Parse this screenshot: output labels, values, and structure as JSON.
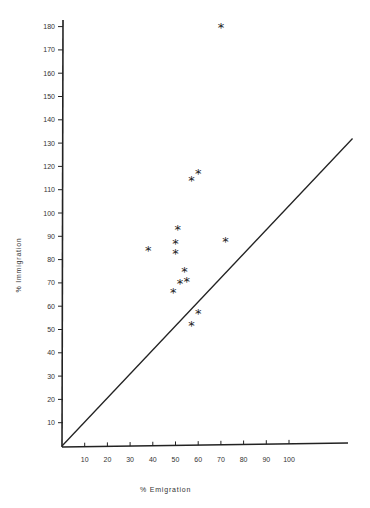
{
  "chart_data": {
    "type": "scatter",
    "title": "",
    "xlabel": "% Emigration",
    "ylabel": "% Immigration",
    "xlim": [
      0,
      128
    ],
    "ylim": [
      0,
      185
    ],
    "x_ticks": [
      10,
      20,
      30,
      40,
      50,
      60,
      70,
      80,
      90,
      100
    ],
    "y_ticks": [
      10,
      20,
      30,
      40,
      50,
      60,
      70,
      80,
      90,
      100,
      110,
      120,
      130,
      140,
      150,
      160,
      170,
      180
    ],
    "grid": false,
    "legend": null,
    "marker": "*",
    "points": [
      {
        "x": 70,
        "y": 180
      },
      {
        "x": 60,
        "y": 117
      },
      {
        "x": 57,
        "y": 114
      },
      {
        "x": 51,
        "y": 93
      },
      {
        "x": 50,
        "y": 87
      },
      {
        "x": 72,
        "y": 88
      },
      {
        "x": 38,
        "y": 84
      },
      {
        "x": 50,
        "y": 83
      },
      {
        "x": 54,
        "y": 75
      },
      {
        "x": 55,
        "y": 71
      },
      {
        "x": 52,
        "y": 70
      },
      {
        "x": 49,
        "y": 66
      },
      {
        "x": 60,
        "y": 57
      },
      {
        "x": 57,
        "y": 52
      }
    ],
    "reference_line": {
      "label": "y = x",
      "from": [
        0,
        0
      ],
      "to": [
        128,
        132
      ]
    }
  },
  "axes": {
    "xlabel": "% Emigration",
    "ylabel": "% Immigration"
  }
}
